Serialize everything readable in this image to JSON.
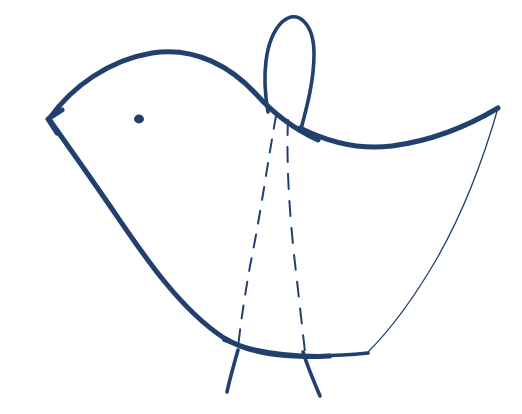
{
  "artwork": {
    "title": "Hand-drawn Bird",
    "subject": "bird",
    "medium": "ink pen line drawing",
    "style": "hand-drawn sketch",
    "background_color": "#ffffff",
    "ink_color": "#22406e",
    "canvas": {
      "width": 522,
      "height": 414
    },
    "visible_text": "",
    "parts": [
      {
        "name": "head-crest",
        "label": "head crest loop",
        "stroke": "medium",
        "path": "M268,112 C262,78 264,40 282,22 C298,8 314,24 314,54 C314,82 306,110 301,129"
      },
      {
        "name": "head-back-outline",
        "label": "head and back outline",
        "stroke": "thick",
        "path": "M49,119 C72,86 110,60 152,53 C196,46 232,68 256,94 C272,112 292,128 318,140"
      },
      {
        "name": "beak",
        "label": "pointed beak",
        "stroke": "thick",
        "path": "M62,110 L48,119 L57,133"
      },
      {
        "name": "breast-belly-outline",
        "label": "breast and belly outline",
        "stroke": "thick",
        "path": "M49,119 C68,146 88,174 110,206 C140,250 178,308 224,338 C252,355 288,358 330,356"
      },
      {
        "name": "wing-tail-upper-edge",
        "label": "upper wing and tail edge",
        "stroke": "thick",
        "path": "M300,128 C330,143 360,150 392,146 C430,141 468,126 498,108"
      },
      {
        "name": "tail-inner-edge",
        "label": "tail inner thin edge",
        "stroke": "hair",
        "path": "M498,108 C486,150 466,208 436,260 C408,308 382,338 368,352"
      },
      {
        "name": "body-bottom-edge",
        "label": "body bottom edge",
        "stroke": "medium",
        "path": "M224,340 C264,356 312,359 368,353"
      },
      {
        "name": "wing-dashed-front",
        "label": "front dashed wing line",
        "stroke": "dash",
        "path": "M276,116 C268,160 260,218 250,266 C244,300 240,328 238,348"
      },
      {
        "name": "wing-dashed-back",
        "label": "back dashed wing line",
        "stroke": "dash-2",
        "path": "M288,120 C286,166 290,222 296,272 C300,308 303,334 305,352"
      },
      {
        "name": "leg-left",
        "label": "left leg",
        "stroke": "medium",
        "path": "M238,350 C234,364 230,378 227,392"
      },
      {
        "name": "leg-right",
        "label": "right leg",
        "stroke": "medium",
        "path": "M303,352 C308,368 314,382 320,396"
      },
      {
        "name": "eye",
        "label": "eye dot",
        "shape": "ellipse",
        "cx": 139,
        "cy": 119,
        "rx": 5.0,
        "ry": 4.4
      }
    ]
  }
}
